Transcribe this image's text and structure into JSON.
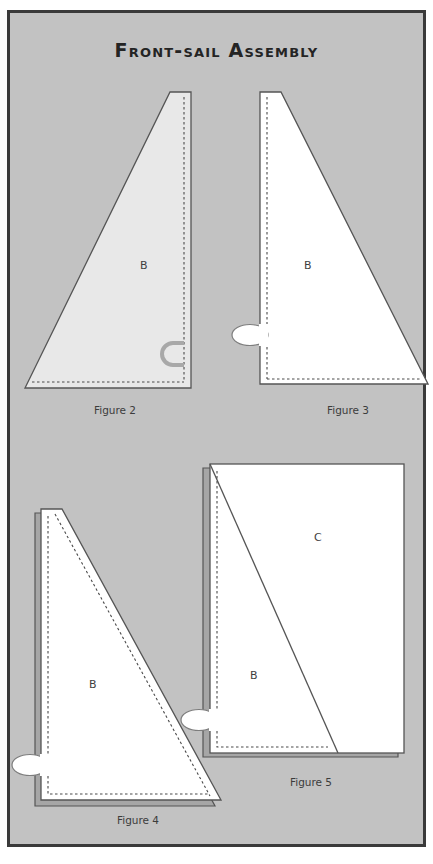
{
  "page": {
    "title": "Front-sail Assembly",
    "background_color": "#c2c2c2",
    "frame_border_color": "#3a3a3a"
  },
  "figures": [
    {
      "id": "figure-2",
      "caption": "Figure 2",
      "piece_labels": [
        "B"
      ],
      "fill_color": "#e8e8e8",
      "outline_color": "#555555",
      "shape": "right-triangle-apex-top-right",
      "loop": {
        "name": "fabric-loop",
        "color": "#a8a8a8",
        "style": "gray-open-loop"
      }
    },
    {
      "id": "figure-3",
      "caption": "Figure 3",
      "piece_labels": [
        "B"
      ],
      "fill_color": "#ffffff",
      "outline_color": "#555555",
      "shape": "right-triangle-apex-top-left",
      "loop": {
        "name": "fabric-loop",
        "color": "#ffffff",
        "style": "white-ellipse-loop"
      }
    },
    {
      "id": "figure-4",
      "caption": "Figure 4",
      "piece_labels": [
        "B"
      ],
      "fill_color": "#ffffff",
      "outline_color": "#555555",
      "shadow_color": "#9d9d9d",
      "shape": "right-triangle-with-offset-backing",
      "loop": {
        "name": "fabric-loop",
        "color": "#ffffff",
        "style": "white-ellipse-loop"
      }
    },
    {
      "id": "figure-5",
      "caption": "Figure 5",
      "piece_labels": [
        "B",
        "C"
      ],
      "fill_color": "#ffffff",
      "outline_color": "#555555",
      "shadow_color": "#9d9d9d",
      "shape": "rectangle-split-by-diagonal",
      "loop": {
        "name": "fabric-loop",
        "color": "#ffffff",
        "style": "white-ellipse-loop"
      }
    }
  ]
}
